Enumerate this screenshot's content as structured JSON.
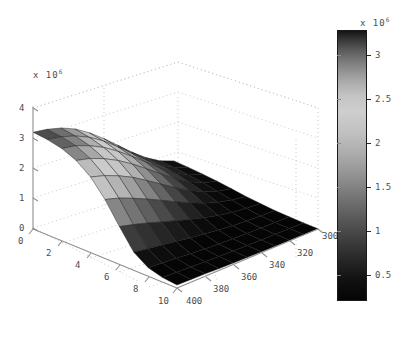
{
  "chart_data": {
    "type": "surface",
    "title": "",
    "xlabel": "",
    "ylabel": "",
    "zlabel": "",
    "grid": true,
    "legend_position": "none",
    "z_exponent_label": "x 10",
    "z_exponent_sup": "6",
    "colorbar_exponent_label": "x 10",
    "colorbar_exponent_sup": "6",
    "x_ticks": [
      "0",
      "2",
      "4",
      "6",
      "8",
      "10"
    ],
    "x_values": [
      0,
      2,
      4,
      6,
      8,
      10
    ],
    "xlim": [
      0,
      10
    ],
    "y_ticks": [
      "300",
      "320",
      "340",
      "360",
      "380",
      "400"
    ],
    "y_values": [
      300,
      320,
      340,
      360,
      380,
      400
    ],
    "ylim": [
      300,
      400
    ],
    "z_ticks": [
      "0",
      "1",
      "2",
      "3",
      "4"
    ],
    "z_values": [
      0,
      1000000,
      2000000,
      3000000,
      4000000
    ],
    "zlim": [
      0,
      4000000
    ],
    "colorbar_ticks": [
      "0.5",
      "1",
      "1.5",
      "2",
      "2.5",
      "3"
    ],
    "colorbar_values": [
      500000,
      1000000,
      1500000,
      2000000,
      2500000,
      3000000
    ],
    "colorbar_range": [
      200000,
      3300000
    ],
    "colormap": "gray-banded",
    "surface_note": "Surface z(x,y) decreasing with x and y; ridge at low x / low y near 3.2e6, falling to near 0 at high x / high y",
    "surface_z_rows": [
      [
        3.2,
        3.15,
        3.05,
        2.85,
        2.5,
        1.95,
        1.25,
        0.6,
        0.28,
        0.15,
        0.1
      ],
      [
        3.1,
        3.05,
        2.95,
        2.72,
        2.35,
        1.8,
        1.12,
        0.52,
        0.24,
        0.13,
        0.09
      ],
      [
        2.95,
        2.88,
        2.75,
        2.52,
        2.15,
        1.6,
        0.98,
        0.45,
        0.2,
        0.11,
        0.08
      ],
      [
        2.72,
        2.64,
        2.5,
        2.26,
        1.9,
        1.38,
        0.82,
        0.37,
        0.16,
        0.09,
        0.06
      ],
      [
        2.4,
        2.32,
        2.18,
        1.95,
        1.6,
        1.14,
        0.66,
        0.29,
        0.12,
        0.07,
        0.05
      ],
      [
        2.02,
        1.94,
        1.81,
        1.6,
        1.29,
        0.9,
        0.51,
        0.22,
        0.09,
        0.05,
        0.04
      ],
      [
        1.6,
        1.53,
        1.42,
        1.24,
        0.98,
        0.67,
        0.37,
        0.16,
        0.07,
        0.04,
        0.03
      ],
      [
        1.18,
        1.12,
        1.03,
        0.89,
        0.69,
        0.46,
        0.25,
        0.11,
        0.05,
        0.03,
        0.02
      ],
      [
        0.8,
        0.76,
        0.69,
        0.59,
        0.45,
        0.3,
        0.16,
        0.07,
        0.03,
        0.02,
        0.015
      ],
      [
        0.5,
        0.47,
        0.42,
        0.36,
        0.27,
        0.18,
        0.1,
        0.04,
        0.02,
        0.012,
        0.01
      ],
      [
        0.3,
        0.28,
        0.25,
        0.21,
        0.16,
        0.1,
        0.06,
        0.025,
        0.012,
        0.008,
        0.006
      ]
    ],
    "surface_z_units": "millions"
  },
  "colors": {
    "axis_line": "#8f8f8f",
    "grid_dot": "#c9c9c9",
    "text": "#4d4d4d",
    "mesh_edge": "#1c1c1c",
    "band_darkest": "#0a0a0a",
    "band_dark": "#353535",
    "band_mid": "#6e6e6e",
    "band_light": "#c2c2c2",
    "background": "#ffffff"
  }
}
